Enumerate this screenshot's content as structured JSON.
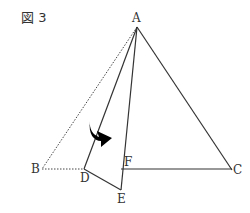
{
  "figure": {
    "title": "図 3",
    "labels": {
      "A": "A",
      "B": "B",
      "C": "C",
      "D": "D",
      "E": "E",
      "F": "F"
    },
    "points": {
      "A": [
        137,
        27
      ],
      "B": [
        42,
        169
      ],
      "C": [
        232,
        170
      ],
      "D": [
        84,
        169
      ],
      "E": [
        121,
        190
      ],
      "F": [
        121,
        169
      ]
    },
    "solid_segments": [
      [
        "A",
        "C"
      ],
      [
        "F",
        "C"
      ],
      [
        "A",
        "D"
      ],
      [
        "D",
        "E"
      ],
      [
        "A",
        "E"
      ]
    ],
    "dotted_segments": [
      [
        "A",
        "B"
      ],
      [
        "B",
        "D"
      ]
    ],
    "arrow": {
      "meaning": "fold direction",
      "color": "#000000"
    }
  }
}
